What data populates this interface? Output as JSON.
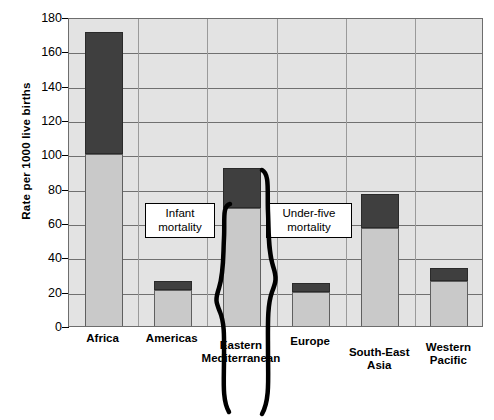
{
  "chart_data": {
    "type": "bar",
    "title": "",
    "subtitle": "",
    "xlabel": "",
    "ylabel": "Rate per 1000 live births",
    "ylim": [
      0,
      180
    ],
    "ytick_step": 20,
    "yticks": [
      0,
      20,
      40,
      60,
      80,
      100,
      120,
      140,
      160,
      180
    ],
    "ytick_labels": [
      "0",
      "20",
      "40",
      "60",
      "80",
      "100",
      "120",
      "140",
      "160",
      "180"
    ],
    "grid": "horizontal",
    "legend_position": "none",
    "stacked": true,
    "categories": [
      "Africa",
      "Americas",
      "Eastern Mediterranean",
      "Europe",
      "South-East Asia",
      "Western Pacific"
    ],
    "series": [
      {
        "name": "Infant mortality",
        "color": "#c9c9c9",
        "values": [
          100,
          21,
          69,
          20,
          57,
          26
        ]
      },
      {
        "name": "Under-five mortality",
        "color": "#3f3f3f",
        "values": [
          171,
          26,
          92,
          25,
          77,
          34
        ]
      }
    ],
    "annotations": [
      {
        "id": "infant-mortality-callout",
        "text_line1": "Infant",
        "text_line2": "mortality",
        "points_to": "Eastern Mediterranean lower (light) segment"
      },
      {
        "id": "under-five-mortality-callout",
        "text_line1": "Under-five",
        "text_line2": "mortality",
        "points_to": "Eastern Mediterranean full bar"
      }
    ],
    "braces": [
      {
        "id": "infant-brace",
        "from": 0,
        "to": 69
      },
      {
        "id": "under-five-brace",
        "from": 0,
        "to": 92
      }
    ]
  }
}
